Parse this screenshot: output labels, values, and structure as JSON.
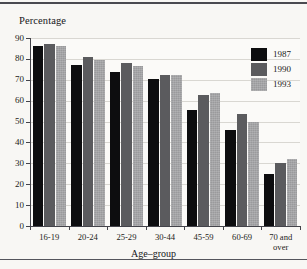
{
  "figure": {
    "background_color": "#f8f7f4",
    "rule_color": "#4a4a50"
  },
  "chart_data": {
    "type": "bar",
    "title": "",
    "subtitle": "",
    "ylabel": "Percentage",
    "xlabel": "Age–group",
    "categories": [
      "16-19",
      "20-24",
      "25-29",
      "30-44",
      "45-59",
      "60-69",
      "70 and\nover"
    ],
    "ylim": [
      0,
      90
    ],
    "yticks": [
      0,
      10,
      20,
      30,
      40,
      50,
      60,
      70,
      80,
      90
    ],
    "grid": true,
    "grid_axis": "y",
    "legend_position": "top-right",
    "series": [
      {
        "name": "1987",
        "color": "#0d0d0f",
        "values": [
          86,
          77,
          73.5,
          70.5,
          55.5,
          46,
          25
        ]
      },
      {
        "name": "1990",
        "color": "#5b5b5e",
        "values": [
          87,
          81,
          78,
          72.5,
          62.5,
          53.5,
          30
        ]
      },
      {
        "name": "1993",
        "color": "#9a9a9c",
        "values": [
          86,
          79.5,
          76.5,
          72.5,
          63.5,
          50,
          32
        ]
      }
    ]
  }
}
